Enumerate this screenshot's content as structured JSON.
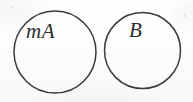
{
  "figure": {
    "kind": "set-diagram",
    "background_color": "#fcfcfc",
    "stroke_color": "#3a3a3a",
    "text_color": "#2e2e2e"
  },
  "circles": [
    {
      "id": "left",
      "label": "mA",
      "cx": 55,
      "cy": 52,
      "r": 41,
      "stroke_width": 1.5
    },
    {
      "id": "right",
      "label": "B",
      "cx": 142.5,
      "cy": 50.5,
      "r": 38,
      "stroke_width": 1.5
    }
  ],
  "labels": {
    "left_circle": "mA",
    "right_circle": "B"
  }
}
